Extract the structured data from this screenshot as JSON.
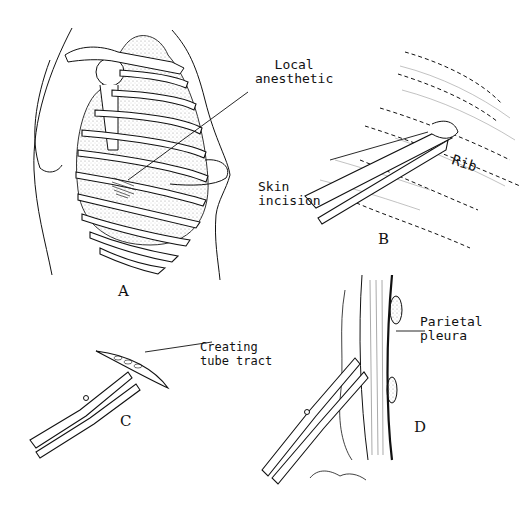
{
  "figure": {
    "watermark": "",
    "panels": [
      {
        "id": "A",
        "letter": "A",
        "labels": [
          "Local\nanesthetic"
        ]
      },
      {
        "id": "B",
        "letter": "B",
        "labels": [
          "Skin\nincision",
          "Rib"
        ]
      },
      {
        "id": "C",
        "letter": "C",
        "labels": [
          "Creating\ntube tract"
        ]
      },
      {
        "id": "D",
        "letter": "D",
        "labels": [
          "Parietal\npleura"
        ]
      }
    ]
  },
  "colors": {
    "ink": "#111111",
    "background": "#ffffff",
    "stipple": "#999999"
  }
}
